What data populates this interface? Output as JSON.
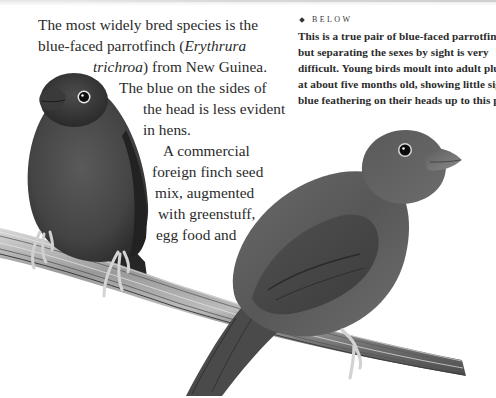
{
  "page": {
    "background": "#ffffff",
    "text_color": "#2a2a2a"
  },
  "body_text": {
    "lines": [
      {
        "text": "The most widely bred species is the"
      },
      {
        "text": "blue-faced parrotfinch ("
      },
      {
        "text": "Erythrura"
      },
      {
        "text": "trichroa"
      },
      {
        "text": ") from New Guinea."
      },
      {
        "text": "The blue on the sides of"
      },
      {
        "text": "the head is less evident"
      },
      {
        "text": "in hens."
      },
      {
        "text": "A commercial"
      },
      {
        "text": "foreign finch seed"
      },
      {
        "text": "mix, augmented"
      },
      {
        "text": "with greenstuff,"
      },
      {
        "text": "egg food and"
      }
    ]
  },
  "caption": {
    "label": "BELOW",
    "lines": [
      "This is a true pair of blue-faced parrotfinches,",
      "but separating the sexes by sight is very",
      "difficult. Young birds moult into adult plumage",
      "at about five months old, showing little sign of",
      "blue feathering on their heads up to this point."
    ]
  },
  "illustration": {
    "subjects": [
      {
        "name": "hen parrotfinch (left, facing viewer)",
        "tone": "#3f3f3f"
      },
      {
        "name": "cock parrotfinch (right, in profile)",
        "tone": "#5a5a5a"
      }
    ],
    "perch": "diagonal reed perch",
    "perch_tone": "#8c8c8c"
  }
}
